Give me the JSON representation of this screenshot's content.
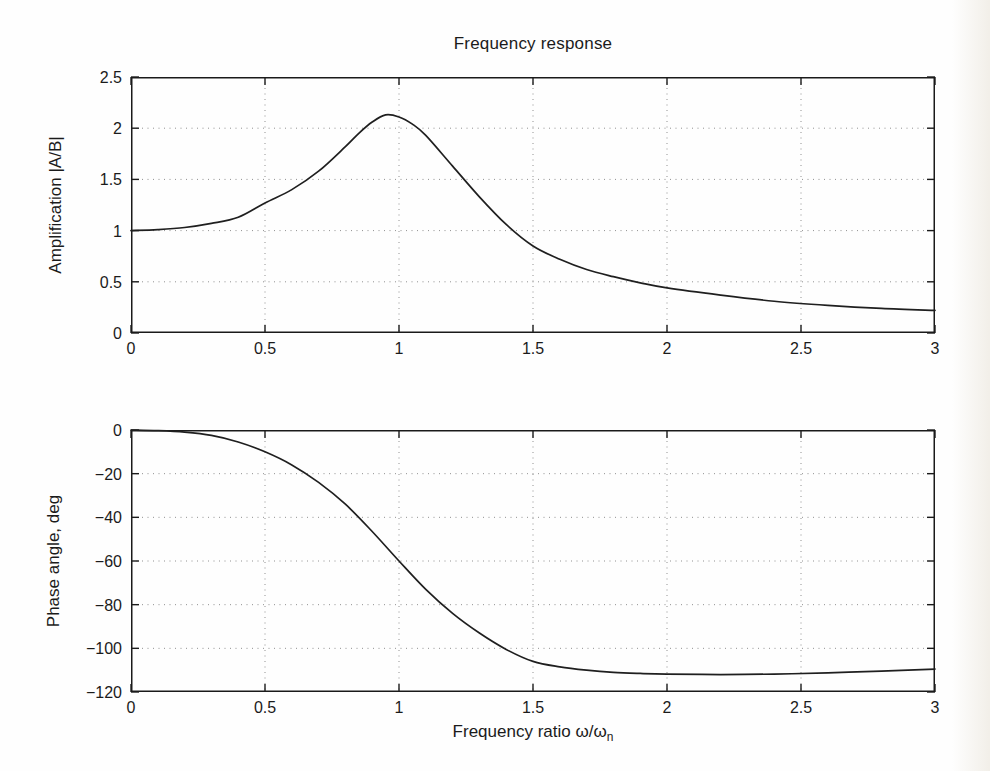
{
  "figure": {
    "title": "Frequency response",
    "background_color": "#fefefe",
    "paper_edge_tint": "#d5cbb6",
    "axis_color": "#1a1a1a",
    "curve_color": "#1f1f1f",
    "grid_color": "#909090",
    "xlabel_prefix": "Frequency ratio ω/ω",
    "xlabel_subscript": "n"
  },
  "chart_data": [
    {
      "type": "line",
      "title": "Frequency response",
      "xlabel": "",
      "ylabel": "Amplification |A/B|",
      "xlim": [
        0,
        3
      ],
      "ylim": [
        0,
        2.5
      ],
      "grid": true,
      "xticks": {
        "values": [
          0,
          0.5,
          1,
          1.5,
          2,
          2.5,
          3
        ],
        "labels": [
          "0",
          "0.5",
          "1",
          "1.5",
          "2",
          "2.5",
          "3"
        ]
      },
      "yticks": {
        "values": [
          0,
          0.5,
          1,
          1.5,
          2,
          2.5
        ],
        "labels": [
          "0",
          "0.5",
          "1",
          "1.5",
          "2",
          "2.5"
        ]
      },
      "series": [
        {
          "name": "amplification",
          "x": [
            0,
            0.1,
            0.2,
            0.3,
            0.4,
            0.5,
            0.6,
            0.7,
            0.8,
            0.85,
            0.9,
            0.95,
            1.0,
            1.05,
            1.1,
            1.2,
            1.3,
            1.4,
            1.5,
            1.6,
            1.7,
            1.8,
            1.9,
            2.0,
            2.2,
            2.4,
            2.6,
            2.8,
            3.0
          ],
          "y": [
            1.0,
            1.01,
            1.03,
            1.07,
            1.13,
            1.27,
            1.4,
            1.58,
            1.82,
            1.95,
            2.06,
            2.13,
            2.11,
            2.04,
            1.93,
            1.63,
            1.33,
            1.06,
            0.85,
            0.72,
            0.62,
            0.55,
            0.49,
            0.44,
            0.37,
            0.31,
            0.27,
            0.24,
            0.22
          ]
        }
      ]
    },
    {
      "type": "line",
      "title": "",
      "xlabel": "Frequency ratio ω/ωₙ",
      "ylabel": "Phase angle, deg",
      "xlim": [
        0,
        3
      ],
      "ylim": [
        -120,
        0
      ],
      "grid": true,
      "xticks": {
        "values": [
          0,
          0.5,
          1,
          1.5,
          2,
          2.5,
          3
        ],
        "labels": [
          "0",
          "0.5",
          "1",
          "1.5",
          "2",
          "2.5",
          "3"
        ]
      },
      "yticks": {
        "values": [
          0,
          -20,
          -40,
          -60,
          -80,
          -100,
          -120
        ],
        "labels": [
          "0",
          "−20",
          "−40",
          "−60",
          "−80",
          "−100",
          "−120"
        ]
      },
      "series": [
        {
          "name": "phase-angle",
          "x": [
            0,
            0.1,
            0.2,
            0.3,
            0.4,
            0.5,
            0.6,
            0.7,
            0.8,
            0.9,
            1.0,
            1.1,
            1.2,
            1.3,
            1.4,
            1.5,
            1.6,
            1.7,
            1.8,
            1.9,
            2.0,
            2.2,
            2.4,
            2.6,
            2.8,
            3.0
          ],
          "y": [
            0,
            -0.3,
            -1.0,
            -2.5,
            -5.5,
            -10,
            -16,
            -24,
            -34,
            -46.5,
            -60,
            -73,
            -84,
            -93,
            -100.5,
            -106,
            -108.5,
            -110,
            -111,
            -111.5,
            -111.8,
            -112,
            -111.8,
            -111.2,
            -110.4,
            -109.5
          ]
        }
      ]
    }
  ]
}
